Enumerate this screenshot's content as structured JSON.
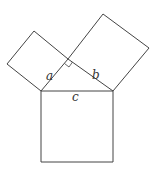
{
  "diagram": {
    "labels": {
      "a": "a",
      "b": "b",
      "c": "c"
    },
    "stroke_color": "#444444",
    "vertices": {
      "A": [
        41,
        91
      ],
      "B": [
        113,
        91
      ],
      "C": [
        68,
        59
      ]
    },
    "squares": {
      "on_a": [
        [
          41,
          91
        ],
        [
          68,
          59
        ],
        [
          34,
          31
        ],
        [
          7,
          64
        ]
      ],
      "on_b": [
        [
          68,
          59
        ],
        [
          113,
          91
        ],
        [
          149,
          48
        ],
        [
          103,
          14
        ]
      ],
      "on_c": [
        [
          41,
          91
        ],
        [
          113,
          91
        ],
        [
          113,
          162
        ],
        [
          41,
          162
        ]
      ]
    },
    "right_angle_marker": true
  }
}
